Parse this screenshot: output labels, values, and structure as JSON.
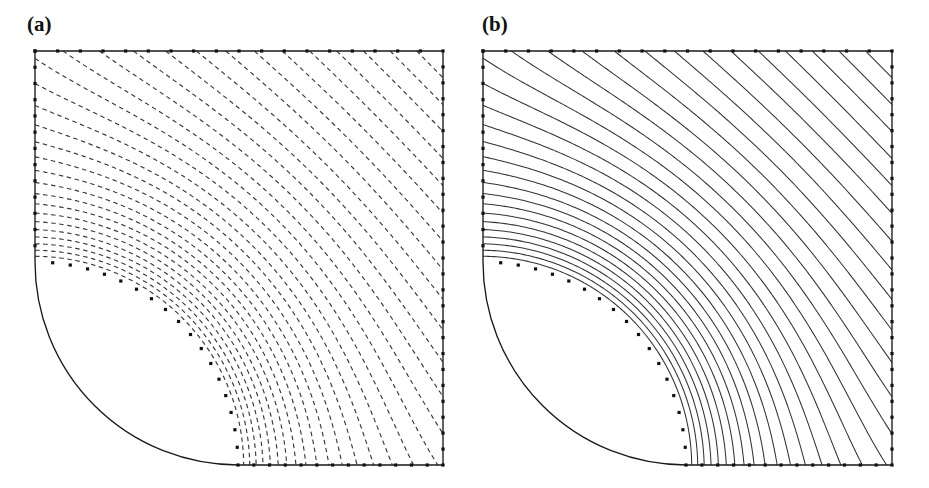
{
  "figure": {
    "kind": "two-panel-field-plot",
    "background_color": "#ffffff"
  },
  "panels": [
    {
      "id": "a",
      "label": "(a)",
      "line_style": "dashed",
      "line_color": "#3a3a3a",
      "description": "flux lines / streamlines",
      "domain": {
        "x0": 35,
        "y0": 51,
        "x1": 443,
        "y1": 465
      },
      "cutout": {
        "type": "quarter-circle",
        "cx": 35,
        "cy": 465,
        "r": 203
      },
      "contour_count": 30
    },
    {
      "id": "b",
      "label": "(b)",
      "line_style": "solid",
      "line_color": "#333333",
      "description": "equipotential lines",
      "domain": {
        "x0": 483,
        "y0": 51,
        "x1": 892,
        "y1": 465
      },
      "cutout": {
        "type": "quarter-circle",
        "cx": 483,
        "cy": 465,
        "r": 203
      },
      "contour_count": 30
    }
  ],
  "boundary": {
    "stroke_color": "#1a1a1a",
    "node_marker": "square",
    "node_color": "#111111",
    "node_size": 3.2,
    "nodes_top": 18,
    "nodes_left": 13,
    "nodes_right": 26,
    "nodes_bottom": 13,
    "nodes_arc": 18
  },
  "chart_data": {
    "type": "line",
    "title": "",
    "subtitle": "",
    "xlabel": "",
    "ylabel": "",
    "grid": false,
    "legend_position": "none",
    "annotations": [
      "(a)",
      "(b)"
    ],
    "series": [
      {
        "name": "(a) flux lines",
        "style": "dashed",
        "count": 30
      },
      {
        "name": "(b) equipotential lines",
        "style": "solid",
        "count": 30
      }
    ]
  }
}
